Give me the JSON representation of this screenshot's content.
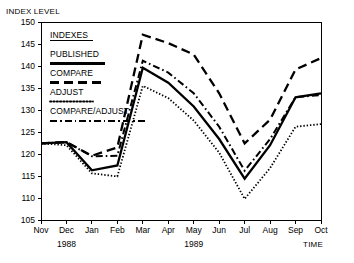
{
  "chart_data": {
    "type": "line",
    "title": "",
    "ylabel": "INDEX LEVEL",
    "xlabel": "TIME",
    "ylim": [
      105,
      150
    ],
    "ytick_step": 5,
    "yticks": [
      105,
      110,
      115,
      120,
      125,
      130,
      135,
      140,
      145,
      150
    ],
    "categories": [
      "Nov",
      "Dec",
      "Jan",
      "Feb",
      "Mar",
      "Apr",
      "May",
      "Jun",
      "Jul",
      "Aug",
      "Sep",
      "Oct"
    ],
    "group_labels": [
      {
        "text": "1988",
        "center_category": "Dec"
      },
      {
        "text": "1989",
        "center_category": "May"
      }
    ],
    "grid": false,
    "legend_position": "upper-left-inside",
    "legend_title": "INDEXES",
    "series": [
      {
        "name": "PUBLISHED",
        "style": "solid",
        "values": [
          122.4,
          122.7,
          116.3,
          117.4,
          139.6,
          136.2,
          130.8,
          123.4,
          114.4,
          122.0,
          132.9,
          133.8
        ]
      },
      {
        "name": "COMPARE",
        "style": "long-dash",
        "values": [
          122.4,
          122.7,
          119.6,
          121.5,
          147.1,
          145.2,
          142.6,
          133.8,
          122.4,
          127.8,
          139.2,
          141.8
        ]
      },
      {
        "name": "ADJUST",
        "style": "dotted",
        "values": [
          122.4,
          122.0,
          115.6,
          114.9,
          135.5,
          132.7,
          127.6,
          120.3,
          109.8,
          116.8,
          126.2,
          126.8
        ]
      },
      {
        "name": "COMPARE/ADJUST",
        "style": "dash-dot",
        "values": [
          122.4,
          122.7,
          119.5,
          119.6,
          141.2,
          138.5,
          133.8,
          126.2,
          116.2,
          123.4,
          132.9,
          133.4
        ]
      }
    ]
  },
  "legend": {
    "title": "INDEXES",
    "entries": [
      {
        "label": "PUBLISHED",
        "style": "solid"
      },
      {
        "label": "COMPARE",
        "style": "long-dash"
      },
      {
        "label": "ADJUST",
        "style": "dotted"
      },
      {
        "label": "COMPARE/ADJUST",
        "style": "dash-dot"
      }
    ]
  },
  "axes": {
    "y_axis_title": "INDEX LEVEL",
    "x_axis_title": "TIME"
  },
  "colors": {
    "line": "#000000",
    "axis": "#000000",
    "background": "#ffffff"
  }
}
